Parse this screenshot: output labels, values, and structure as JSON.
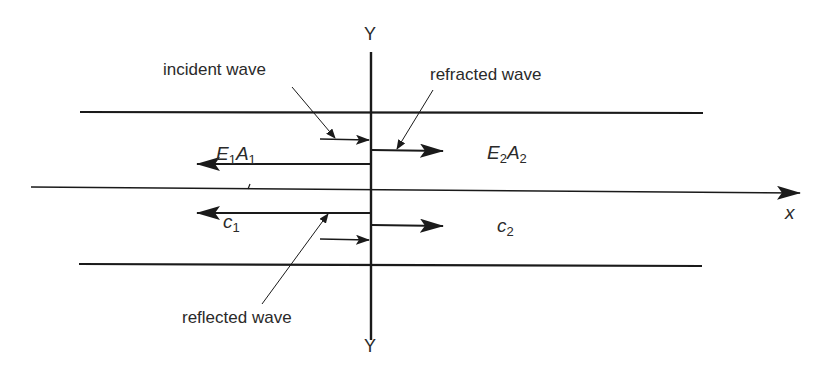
{
  "figure": {
    "type": "wave reflection/refraction at bar junction",
    "interface_label_top": "Y",
    "interface_label_bottom": "Y",
    "axis_label": "x",
    "annotations": {
      "incident": "incident wave",
      "refracted": "refracted wave",
      "reflected": "reflected wave"
    },
    "region_left": {
      "property_1": {
        "E": "E",
        "E_sub": "1",
        "A": "A",
        "A_sub": "1"
      },
      "speed": {
        "c": "c",
        "c_sub": "1"
      }
    },
    "region_right": {
      "property_2": {
        "E": "E",
        "E_sub": "2",
        "A": "A",
        "A_sub": "2"
      },
      "speed": {
        "c": "c",
        "c_sub": "2"
      }
    }
  },
  "colors": {
    "line": "#1a1a1a",
    "text": "#2a2a2a",
    "background": "#ffffff"
  }
}
